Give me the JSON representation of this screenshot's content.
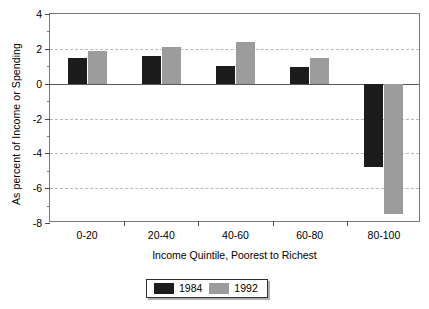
{
  "chart_data": {
    "type": "bar",
    "title": "",
    "xlabel": "Income Quintile, Poorest to Richest",
    "ylabel": "As percent of Income or Spending",
    "categories": [
      "0-20",
      "20-40",
      "40-60",
      "60-80",
      "80-100"
    ],
    "series": [
      {
        "name": "1984",
        "color": "#1c1c1c",
        "values": [
          1.5,
          1.6,
          1.0,
          0.95,
          -4.8
        ]
      },
      {
        "name": "1992",
        "color": "#9c9c9c",
        "values": [
          1.85,
          2.1,
          2.4,
          1.45,
          -7.5
        ]
      }
    ],
    "ylim": [
      -8,
      4
    ],
    "ytick_labels": [
      "4",
      "2",
      "0",
      "-2",
      "-4",
      "-6",
      "-8"
    ],
    "ytick_values": [
      4,
      2,
      0,
      -2,
      -4,
      -6,
      -8
    ],
    "yminor_values": [
      3,
      1,
      -1,
      -3,
      -5,
      -7
    ],
    "gridlines_at": [
      2,
      -2,
      -4,
      -6
    ],
    "grid": true,
    "zero_line": true,
    "legend_position": "bottom-center"
  }
}
